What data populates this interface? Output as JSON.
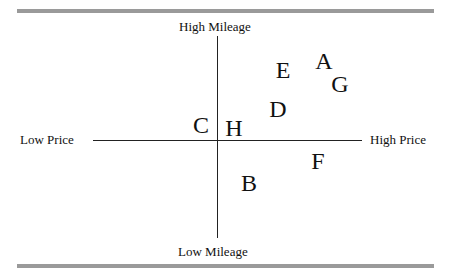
{
  "diagram": {
    "type": "perceptual-map",
    "axes": {
      "y_top_label": "High Mileage",
      "y_bottom_label": "Low Mileage",
      "x_left_label": "Low Price",
      "x_right_label": "High Price"
    },
    "points": [
      {
        "label": "A",
        "x": 324,
        "y": 61
      },
      {
        "label": "B",
        "x": 249,
        "y": 183
      },
      {
        "label": "C",
        "x": 201,
        "y": 125
      },
      {
        "label": "D",
        "x": 278,
        "y": 109
      },
      {
        "label": "E",
        "x": 283,
        "y": 70
      },
      {
        "label": "F",
        "x": 318,
        "y": 161
      },
      {
        "label": "G",
        "x": 340,
        "y": 84
      },
      {
        "label": "H",
        "x": 234,
        "y": 128
      }
    ]
  }
}
